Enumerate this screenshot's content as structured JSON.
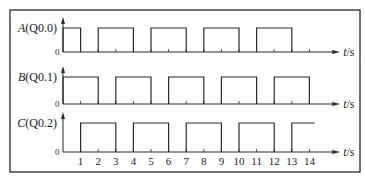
{
  "diagram": {
    "type": "timing_diagram",
    "frame": {
      "x": 10,
      "y": 10,
      "width": 350,
      "height": 162,
      "color": "#2a2a2a"
    },
    "colors": {
      "line": "#2a2a2a",
      "text": "#1a1a1a",
      "background": "#ffffff"
    },
    "axis": {
      "origin_x": 63,
      "px_per_second": 17.6,
      "max_t": 14.5,
      "unit_label": "t/s",
      "tick_labels": [
        "1",
        "2",
        "3",
        "4",
        "5",
        "6",
        "7",
        "8",
        "9",
        "10",
        "11",
        "12",
        "13",
        "14"
      ],
      "zero_label": "0"
    },
    "signals": [
      {
        "id": "A",
        "letter": "A",
        "address": "(Q0.0)",
        "baseline_y": 52,
        "high_y": 28,
        "high_intervals": [
          [
            0,
            1
          ],
          [
            2,
            4
          ],
          [
            5,
            7
          ],
          [
            8,
            10
          ],
          [
            11,
            13
          ]
        ],
        "show_unit": true
      },
      {
        "id": "B",
        "letter": "B",
        "address": "(Q0.1)",
        "baseline_y": 104,
        "high_y": 77,
        "high_intervals": [
          [
            0,
            2
          ],
          [
            3,
            5
          ],
          [
            6,
            8
          ],
          [
            9,
            11
          ],
          [
            12,
            14
          ]
        ],
        "show_unit": true
      },
      {
        "id": "C",
        "letter": "C",
        "address": "(Q0.2)",
        "baseline_y": 152,
        "high_y": 123,
        "high_intervals": [
          [
            1,
            3
          ],
          [
            4,
            6
          ],
          [
            7,
            9
          ],
          [
            10,
            12
          ],
          [
            13,
            14.3
          ]
        ],
        "show_unit": true,
        "show_tick_labels": true
      }
    ]
  }
}
